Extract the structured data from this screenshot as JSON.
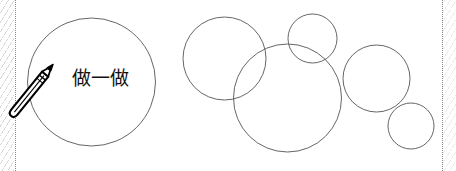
{
  "page": {
    "width": 456,
    "height": 171,
    "background_color": "#ffffff",
    "stroke_color": "#555555",
    "text_color": "#111111"
  },
  "edges": {
    "left_dotted_rule": "dotted-vertical-rule",
    "right_dotted_rule": "dotted-vertical-rule",
    "hatch_pattern": "diagonal-hatch"
  },
  "badge": {
    "icon_name": "pencil-icon",
    "label": "做一做",
    "circle": {
      "cx": 91.5,
      "cy": 82,
      "r": 64
    }
  },
  "diagram": {
    "shape_type": "circle-outline",
    "fill": "none",
    "stroke_width": 0.9,
    "circles": [
      {
        "name": "circle-upper-left",
        "cx": 224.5,
        "cy": 58.5,
        "r": 41.5
      },
      {
        "name": "circle-top-middle",
        "cx": 312.5,
        "cy": 38.5,
        "r": 24.5
      },
      {
        "name": "circle-center-large",
        "cx": 287.5,
        "cy": 98.0,
        "r": 54.0
      },
      {
        "name": "circle-right-medium",
        "cx": 376.5,
        "cy": 78.5,
        "r": 33.5
      },
      {
        "name": "circle-bottom-right",
        "cx": 411.0,
        "cy": 126.0,
        "r": 23.0
      }
    ]
  }
}
